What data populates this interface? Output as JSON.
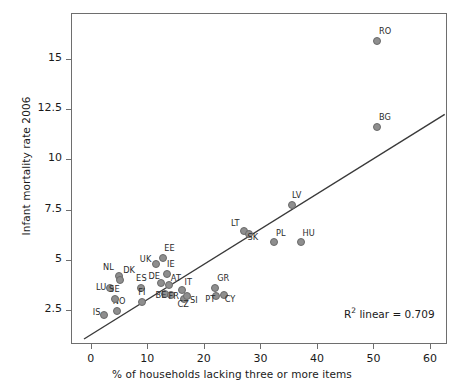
{
  "chart_data": {
    "type": "scatter",
    "title": "",
    "xlabel": "% of households lacking three or more items",
    "ylabel": "Infant mortality rate 2006",
    "xlim": [
      -3.5,
      63
    ],
    "ylim": [
      0.8,
      17.3
    ],
    "xticks": [
      0,
      10,
      20,
      30,
      40,
      50,
      60
    ],
    "xtick_labels": [
      "0",
      "10",
      "20",
      "30",
      "40",
      "50",
      "60"
    ],
    "yticks": [
      2.5,
      5,
      7.5,
      10,
      12.5,
      15
    ],
    "ytick_labels": [
      "2.5",
      "5",
      "7.5",
      "10",
      "12.5",
      "15"
    ],
    "grid": false,
    "legend": null,
    "annotations": [
      {
        "text_prefix": "R",
        "text_sup": "2",
        "text_suffix": " linear = 0.709"
      }
    ],
    "fit_line": {
      "type": "linear",
      "r_squared": 0.709,
      "x_start": -1.2,
      "y_start": 1.05,
      "x_end": 62.6,
      "y_end": 12.25
    },
    "marker_color": "#8e8e8e",
    "marker_edge_color": "#6a6a6a",
    "line_color": "#3a3a3a",
    "axis_color": "#6e6e6e",
    "points": [
      {
        "label": "IS",
        "x": 2.3,
        "y": 2.25,
        "lx": -11,
        "ly": -4
      },
      {
        "label": "LU",
        "x": 3.4,
        "y": 3.6,
        "lx": -14,
        "ly": -2
      },
      {
        "label": "NO",
        "x": 4.6,
        "y": 2.45,
        "lx": -4,
        "ly": -11
      },
      {
        "label": "SE",
        "x": 4.3,
        "y": 3.05,
        "lx": -6,
        "ly": -11
      },
      {
        "label": "NL",
        "x": 5.0,
        "y": 4.2,
        "lx": -16,
        "ly": -10
      },
      {
        "label": "DK",
        "x": 5.2,
        "y": 4.0,
        "lx": 3,
        "ly": -11
      },
      {
        "label": "ES",
        "x": 8.9,
        "y": 3.6,
        "lx": -5,
        "ly": -11
      },
      {
        "label": "FI",
        "x": 9.1,
        "y": 2.9,
        "lx": -4,
        "ly": -11
      },
      {
        "label": "UK",
        "x": 11.5,
        "y": 4.8,
        "lx": -16,
        "ly": -6
      },
      {
        "label": "EE",
        "x": 12.8,
        "y": 5.1,
        "lx": 1,
        "ly": -11
      },
      {
        "label": "DE",
        "x": 12.5,
        "y": 3.85,
        "lx": -13,
        "ly": -8
      },
      {
        "label": "IE",
        "x": 13.5,
        "y": 4.3,
        "lx": 0,
        "ly": -11
      },
      {
        "label": "AT",
        "x": 13.8,
        "y": 3.75,
        "lx": 2,
        "ly": -8
      },
      {
        "label": "BE",
        "x": 13.2,
        "y": 3.3,
        "lx": -10,
        "ly": 0
      },
      {
        "label": "FR",
        "x": 14.1,
        "y": 3.25,
        "lx": -2,
        "ly": 0
      },
      {
        "label": "IT",
        "x": 16.2,
        "y": 3.5,
        "lx": 2,
        "ly": -9
      },
      {
        "label": "CZ",
        "x": 16.4,
        "y": 3.05,
        "lx": -6,
        "ly": 4
      },
      {
        "label": "SI",
        "x": 17.0,
        "y": 3.2,
        "lx": 3,
        "ly": 3
      },
      {
        "label": "GR",
        "x": 22.0,
        "y": 3.6,
        "lx": 2,
        "ly": -11
      },
      {
        "label": "PT",
        "x": 22.2,
        "y": 3.2,
        "lx": -11,
        "ly": 2
      },
      {
        "label": "CY",
        "x": 23.5,
        "y": 3.25,
        "lx": 1,
        "ly": 3
      },
      {
        "label": "LT",
        "x": 27.1,
        "y": 6.45,
        "lx": -13,
        "ly": -9
      },
      {
        "label": "SK",
        "x": 27.9,
        "y": 6.3,
        "lx": -1,
        "ly": 2
      },
      {
        "label": "PL",
        "x": 32.4,
        "y": 5.9,
        "lx": 2,
        "ly": -10
      },
      {
        "label": "LV",
        "x": 35.6,
        "y": 7.75,
        "lx": 0,
        "ly": -11
      },
      {
        "label": "HU",
        "x": 37.1,
        "y": 5.9,
        "lx": 2,
        "ly": -10
      },
      {
        "label": "BG",
        "x": 50.6,
        "y": 11.6,
        "lx": 2,
        "ly": -11
      },
      {
        "label": "RO",
        "x": 50.6,
        "y": 15.9,
        "lx": 2,
        "ly": -11
      }
    ]
  }
}
